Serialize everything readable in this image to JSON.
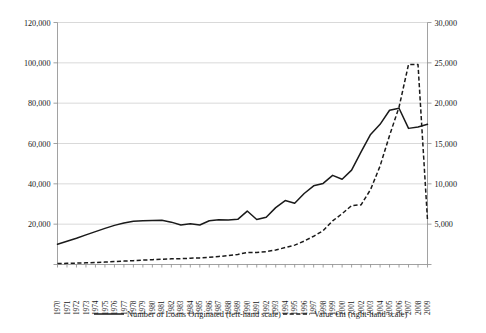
{
  "chart_data": {
    "type": "line",
    "title": "",
    "subtitle": "",
    "xlabel": "",
    "ylabel": "",
    "grid": true,
    "legend_position": "bottom",
    "x": [
      1970,
      1971,
      1972,
      1973,
      1974,
      1975,
      1976,
      1977,
      1978,
      1979,
      1980,
      1981,
      1982,
      1983,
      1984,
      1985,
      1986,
      1987,
      1988,
      1989,
      1990,
      1991,
      1992,
      1993,
      1994,
      1995,
      1996,
      1997,
      1998,
      1999,
      2000,
      2001,
      2002,
      2003,
      2004,
      2005,
      2006,
      2007,
      2008,
      2009
    ],
    "x_tick_labels": [
      "1970",
      "1971",
      "1972",
      "1973",
      "1974",
      "1975",
      "1976",
      "1977",
      "1978",
      "1979",
      "1980",
      "1981",
      "1982",
      "1983",
      "1984",
      "1985",
      "1986",
      "1987",
      "1988",
      "1989",
      "1990",
      "1991",
      "1992",
      "1993",
      "1994",
      "1995",
      "1996",
      "1997",
      "1998",
      "1999",
      "2000",
      "2001",
      "2002",
      "2003",
      "2004",
      "2005",
      "2006",
      "2007",
      "2008",
      "2009"
    ],
    "axes": {
      "left": {
        "label": "Number of Loans Originated (left-hand scale)",
        "min": 0,
        "max": 120000,
        "tick_step": 20000,
        "ticks": [
          0,
          20000,
          40000,
          60000,
          80000,
          100000,
          120000
        ],
        "tick_labels": [
          "-",
          "20,000",
          "40,000",
          "60,000",
          "80,000",
          "100,000",
          "120,000"
        ]
      },
      "right": {
        "label": "Value €m (right-hand scale)",
        "min": 0,
        "max": 30000,
        "tick_step": 5000,
        "ticks": [
          0,
          5000,
          10000,
          15000,
          20000,
          25000,
          30000
        ],
        "tick_labels": [
          "-",
          "5,000",
          "10,000",
          "15,000",
          "20,000",
          "25,000",
          "30,000"
        ]
      }
    },
    "series": [
      {
        "name": "Number of Loans Originated (left-hand scale)",
        "axis": "left",
        "style": "solid",
        "color": "#1a1a1a",
        "values": [
          10000,
          11600,
          13200,
          14900,
          16400,
          18000,
          19600,
          20700,
          21500,
          21800,
          21900,
          22000,
          21000,
          19800,
          20300,
          19700,
          21800,
          22300,
          22200,
          22500,
          26000,
          22200,
          23300,
          28000,
          31500,
          30300,
          34900,
          38700,
          40000,
          44000,
          42000,
          46500,
          55500,
          64000,
          69000,
          76000,
          77000,
          67500,
          68000,
          69000
        ]
      }
    ],
    "series_note": "values listed above are the first-pass left-axis series; full corrected series are in series_left/series_right",
    "series_left": {
      "name": "Number of Loans Originated (left-hand scale)",
      "axis": "left",
      "style": "solid",
      "color": "#1a1a1a",
      "values": [
        10000,
        11500,
        13000,
        14700,
        16300,
        17900,
        19400,
        20600,
        21400,
        21700,
        21800,
        21900,
        21000,
        19600,
        20200,
        19600,
        21700,
        22200,
        22100,
        22400,
        26500,
        22300,
        23400,
        28200,
        31700,
        30400,
        35200,
        39000,
        40200,
        44200,
        42300,
        46800,
        55800,
        64500,
        69500,
        76500,
        77500,
        67500,
        68200,
        69500
      ]
    },
    "series_right": {
      "name": "Value €m (right-hand scale)",
      "axis": "right",
      "style": "dashed",
      "color": "#1a1a1a",
      "values": [
        120,
        140,
        170,
        210,
        250,
        300,
        360,
        420,
        480,
        540,
        600,
        660,
        700,
        720,
        780,
        820,
        900,
        1000,
        1100,
        1250,
        1500,
        1500,
        1600,
        1800,
        2100,
        2400,
        2900,
        3500,
        4200,
        5400,
        6300,
        7300,
        7400,
        9300,
        12200,
        16000,
        19500,
        24800,
        24800,
        5500
      ]
    },
    "corrected_left_values": [
      10000,
      11500,
      13000,
      14700,
      16300,
      17900,
      19400,
      20600,
      21400,
      21700,
      21800,
      21900,
      21000,
      19600,
      20200,
      19600,
      21700,
      22200,
      22100,
      22400,
      26500,
      22300,
      23400,
      28200,
      31700,
      30400,
      35200,
      39000,
      40200,
      44200,
      42300,
      46800,
      55800,
      64500,
      69500,
      76500,
      77500,
      67500,
      68200,
      69500
    ],
    "annotations": []
  },
  "chart_render": {
    "left_series_plot": [
      10000,
      11500,
      13000,
      14700,
      16300,
      17900,
      19400,
      20600,
      21400,
      21700,
      21800,
      21900,
      21000,
      19600,
      20200,
      19600,
      21700,
      22200,
      22100,
      22400,
      26500,
      22300,
      23400,
      28200,
      31700,
      30400,
      35200,
      39000,
      40200,
      44200,
      42300,
      46800,
      55800,
      64500,
      69500,
      76500,
      77500,
      67500,
      68200,
      69500
    ],
    "right_series_plot": [
      120,
      140,
      170,
      210,
      250,
      300,
      360,
      420,
      480,
      540,
      600,
      660,
      700,
      720,
      780,
      820,
      900,
      1000,
      1100,
      1250,
      1500,
      1500,
      1600,
      1800,
      2100,
      2400,
      2900,
      3500,
      4200,
      5400,
      6300,
      7300,
      7400,
      9300,
      12200,
      16000,
      19500,
      24800,
      24800,
      5500
    ]
  },
  "legend": {
    "items": [
      {
        "label": "Number of Loans Originated (left-hand scale)",
        "style": "solid",
        "icon": "line-solid-icon"
      },
      {
        "label": "Value €m (right-hand scale)",
        "style": "dashed",
        "icon": "line-dashed-icon"
      }
    ]
  },
  "left_axis_tick_labels": [
    "-",
    "20,000",
    "40,000",
    "60,000",
    "80,000",
    "100,000",
    "120,000"
  ],
  "right_axis_tick_labels": [
    "-",
    "5,000",
    "10,000",
    "15,000",
    "20,000",
    "25,000",
    "30,000"
  ],
  "colors": {
    "series": "#1a1a1a",
    "grid": "#c8c8c8",
    "frame": "#8a8a8a",
    "background": "#ffffff"
  }
}
